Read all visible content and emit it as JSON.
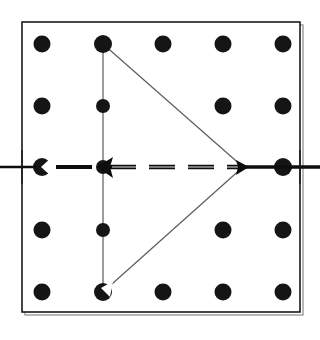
{
  "figure": {
    "title": "Triangle inscribed on a 5x5 dot grid with horizontal dashed axis",
    "caption": "",
    "background_color": "#ffffff",
    "width": 320,
    "height": 340
  },
  "frame": {
    "name": "bounding-square",
    "x": 22,
    "y": 22,
    "width": 278,
    "height": 290,
    "stroke_color": "#1a1a1a",
    "stroke_width": 1.6,
    "fill": "none",
    "shadow_color": "#9a9a9a"
  },
  "grid": {
    "label": "dot-grid",
    "rows": 5,
    "cols": 5,
    "x_positions": [
      42,
      103,
      163,
      223,
      283
    ],
    "y_positions": [
      44,
      106,
      167,
      230,
      292
    ],
    "dot_radius": 8.5,
    "dot_color": "#151515",
    "dots": [
      {
        "id": "dot-r1c1",
        "cx": 42,
        "cy": 44,
        "r": 8.5,
        "state": "plain"
      },
      {
        "id": "dot-r1c2",
        "cx": 103,
        "cy": 44,
        "r": 9.0,
        "state": "vertex-top"
      },
      {
        "id": "dot-r1c3",
        "cx": 163,
        "cy": 44,
        "r": 8.5,
        "state": "plain"
      },
      {
        "id": "dot-r1c4",
        "cx": 223,
        "cy": 44,
        "r": 8.5,
        "state": "plain"
      },
      {
        "id": "dot-r1c5",
        "cx": 283,
        "cy": 44,
        "r": 8.5,
        "state": "plain"
      },
      {
        "id": "dot-r2c1",
        "cx": 42,
        "cy": 106,
        "r": 8.5,
        "state": "plain"
      },
      {
        "id": "dot-r2c2",
        "cx": 103,
        "cy": 106,
        "r": 7.0,
        "state": "clipped-by-edge"
      },
      {
        "id": "dot-r2c4",
        "cx": 223,
        "cy": 106,
        "r": 8.5,
        "state": "plain"
      },
      {
        "id": "dot-r2c5",
        "cx": 283,
        "cy": 106,
        "r": 8.5,
        "state": "plain"
      },
      {
        "id": "dot-r3c1",
        "cx": 42,
        "cy": 167,
        "r": 9.0,
        "state": "notched-right"
      },
      {
        "id": "dot-r3c2",
        "cx": 103,
        "cy": 167,
        "r": 7.0,
        "state": "clipped-by-arrow"
      },
      {
        "id": "dot-r3c5",
        "cx": 283,
        "cy": 167,
        "r": 9.0,
        "state": "on-axis"
      },
      {
        "id": "dot-r4c1",
        "cx": 42,
        "cy": 230,
        "r": 8.5,
        "state": "plain"
      },
      {
        "id": "dot-r4c2",
        "cx": 103,
        "cy": 230,
        "r": 7.0,
        "state": "clipped-by-edge"
      },
      {
        "id": "dot-r4c4",
        "cx": 223,
        "cy": 230,
        "r": 8.5,
        "state": "plain"
      },
      {
        "id": "dot-r4c5",
        "cx": 283,
        "cy": 230,
        "r": 8.5,
        "state": "plain"
      },
      {
        "id": "dot-r5c1",
        "cx": 42,
        "cy": 292,
        "r": 8.5,
        "state": "plain"
      },
      {
        "id": "dot-r5c2",
        "cx": 103,
        "cy": 292,
        "r": 9.0,
        "state": "vertex-bottom-notched"
      },
      {
        "id": "dot-r5c3",
        "cx": 163,
        "cy": 292,
        "r": 8.5,
        "state": "plain"
      },
      {
        "id": "dot-r5c4",
        "cx": 223,
        "cy": 292,
        "r": 8.5,
        "state": "plain"
      },
      {
        "id": "dot-r5c5",
        "cx": 283,
        "cy": 292,
        "r": 8.5,
        "state": "plain"
      }
    ],
    "missing_dots": [
      {
        "id": "dot-r2c3",
        "cx": 163,
        "cy": 106,
        "reason": "occluded-by-upper-diagonal"
      },
      {
        "id": "dot-r4c3",
        "cx": 163,
        "cy": 230,
        "reason": "occluded-by-lower-diagonal"
      },
      {
        "id": "dot-r3c3",
        "cx": 163,
        "cy": 167,
        "reason": "occluded-by-dashed-axis"
      },
      {
        "id": "dot-r3c4",
        "cx": 223,
        "cy": 167,
        "reason": "occluded-by-dashed-axis"
      }
    ]
  },
  "triangle": {
    "label": "isoceles-triangle",
    "stroke_color": "#5c5c5c",
    "stroke_width": 1.2,
    "fill": "none",
    "vertices": [
      {
        "name": "apex-top",
        "x": 103,
        "y": 44
      },
      {
        "name": "apex-right",
        "x": 243,
        "y": 167
      },
      {
        "name": "apex-bottom",
        "x": 103,
        "y": 292
      }
    ],
    "edges": [
      {
        "name": "left-vertical-edge",
        "x1": 103,
        "y1": 44,
        "x2": 103,
        "y2": 292
      },
      {
        "name": "upper-diagonal-edge",
        "x1": 103,
        "y1": 44,
        "x2": 243,
        "y2": 167
      },
      {
        "name": "lower-diagonal-edge",
        "x1": 243,
        "y1": 167,
        "x2": 103,
        "y2": 292
      }
    ]
  },
  "axis": {
    "label": "horizontal-dashed-axis",
    "y": 167,
    "x_start": 0,
    "x_end": 320,
    "stroke_color": "#0d0d0d",
    "stroke_width": 4.2,
    "dash_pattern": "26 13",
    "segments": [
      {
        "name": "axis-segment-left-outer",
        "x1": 0,
        "x2": 34,
        "style": "solid-thin"
      },
      {
        "name": "axis-segment-left-dash",
        "x1": 56,
        "x2": 96,
        "style": "dashed-thick"
      },
      {
        "name": "axis-segment-center-dash",
        "x1": 108,
        "x2": 243,
        "style": "dashed-thick"
      },
      {
        "name": "axis-segment-right-outer",
        "x1": 243,
        "x2": 320,
        "style": "solid-thick"
      }
    ]
  },
  "arrows": [
    {
      "name": "left-arrowhead",
      "tip_x": 99,
      "tip_y": 167,
      "direction": "left",
      "size": 13,
      "color": "#0d0d0d"
    },
    {
      "name": "right-vertex-marker",
      "tip_x": 243,
      "tip_y": 167,
      "direction": "right",
      "size": 9,
      "color": "#0d0d0d"
    }
  ],
  "notches": [
    {
      "name": "left-dot-notch",
      "on_dot": "dot-r3c1",
      "cx": 47,
      "cy": 167,
      "shape": "wedge",
      "color": "#ffffff"
    },
    {
      "name": "bottom-vertex-notch",
      "on_dot": "dot-r5c2",
      "cx": 108,
      "cy": 287,
      "shape": "wedge",
      "color": "#ffffff"
    }
  ]
}
